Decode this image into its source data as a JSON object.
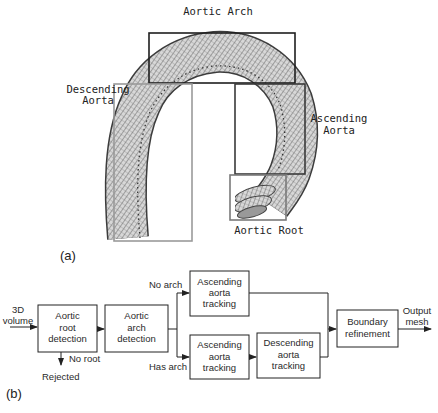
{
  "part_a": {
    "panel_label": "(a)",
    "regions": [
      {
        "id": "arch",
        "label": "Aortic Arch",
        "box": {
          "x": 149,
          "y": 33,
          "w": 146,
          "h": 50
        },
        "stroke": "#1e1e1e"
      },
      {
        "id": "descending",
        "label_line1": "Descending",
        "label_line2": "Aorta",
        "box": {
          "x": 114,
          "y": 84,
          "w": 78,
          "h": 157
        },
        "stroke": "#9a9a9a"
      },
      {
        "id": "ascending",
        "label_line1": "Ascending",
        "label_line2": "Aorta",
        "box": {
          "x": 235,
          "y": 84,
          "w": 70,
          "h": 90
        },
        "stroke": "#3a3a3a"
      },
      {
        "id": "root",
        "label": "Aortic Root",
        "box": {
          "x": 230,
          "y": 175,
          "w": 56,
          "h": 45
        },
        "stroke": "#7a7a7a"
      }
    ]
  },
  "part_b": {
    "panel_label": "(b)",
    "input_label_line1": "3D",
    "input_label_line2": "volume",
    "output_label_line1": "Output",
    "output_label_line2": "mesh",
    "boxes": [
      {
        "id": "root-detection",
        "lines": [
          "Aortic",
          "root",
          "detection"
        ]
      },
      {
        "id": "arch-detection",
        "lines": [
          "Aortic",
          "arch",
          "detection"
        ]
      },
      {
        "id": "ascending-tracking-top",
        "lines": [
          "Ascending",
          "aorta",
          "tracking"
        ]
      },
      {
        "id": "ascending-tracking-bottom",
        "lines": [
          "Ascending",
          "aorta",
          "tracking"
        ]
      },
      {
        "id": "descending-tracking",
        "lines": [
          "Descending",
          "aorta",
          "tracking"
        ]
      },
      {
        "id": "boundary-refinement",
        "lines": [
          "Boundary",
          "refinement"
        ]
      }
    ],
    "edge_labels": {
      "no_arch": "No arch",
      "has_arch": "Has arch",
      "no_root": "No root",
      "rejected": "Rejected"
    }
  }
}
